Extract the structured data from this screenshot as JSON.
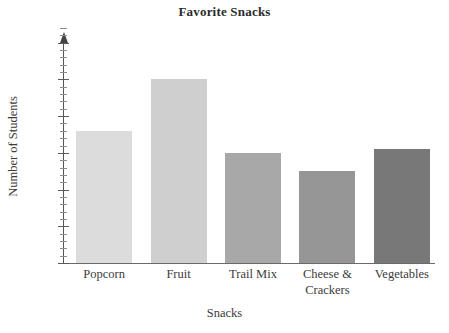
{
  "chart_data": {
    "type": "bar",
    "title": "Favorite Snacks",
    "xlabel": "Snacks",
    "ylabel": "Number of Students",
    "categories": [
      "Popcorn",
      "Fruit",
      "Trail Mix",
      "Cheese & Crackers",
      "Vegetables"
    ],
    "category_lines": [
      [
        "Popcorn"
      ],
      [
        "Fruit"
      ],
      [
        "Trail Mix"
      ],
      [
        "Cheese &",
        "Crackers"
      ],
      [
        "Vegetables"
      ]
    ],
    "values": [
      18,
      25,
      15,
      12.5,
      15.5
    ],
    "ylim": [
      0,
      32
    ],
    "ytick_labels": [
      "0",
      "5",
      "10",
      "15",
      "20",
      "25",
      "30"
    ],
    "ytick_values": [
      0,
      5,
      10,
      15,
      20,
      25,
      30
    ],
    "minor_tick_step": 1,
    "grid": false,
    "legend": "none",
    "bar_colors": [
      "#dcdcdc",
      "#cfcfcf",
      "#a8a8a8",
      "#969696",
      "#787878"
    ],
    "axis_color": "#555555",
    "text_color": "#3b3b3b",
    "background": "#ffffff"
  }
}
